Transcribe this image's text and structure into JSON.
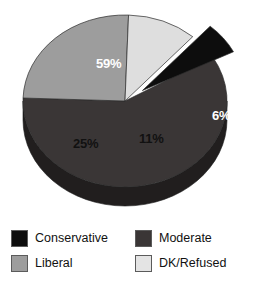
{
  "chart_data": {
    "type": "pie",
    "title": "",
    "subtitle": "",
    "xlabel": "",
    "ylabel": "",
    "style": "3d-exploded",
    "grid": false,
    "legend_position": "bottom",
    "categories": [
      "Conservative",
      "Moderate",
      "Liberal",
      "DK/Refused"
    ],
    "values": [
      6,
      59,
      25,
      11
    ],
    "value_unit": "%",
    "slices": [
      {
        "name": "Moderate",
        "value": 59,
        "label": "59%",
        "color": "#3a3636",
        "side_color": "#211e1e",
        "label_color": "#ffffff",
        "exploded": false,
        "start_deg": 178,
        "end_deg": 390.4
      },
      {
        "name": "Liberal",
        "value": 25,
        "label": "25%",
        "color": "#9d9d9d",
        "side_color": "#6e6e6e",
        "label_color": "#111111",
        "exploded": false,
        "start_deg": 88,
        "end_deg": 178
      },
      {
        "name": "DK/Refused",
        "value": 11,
        "label": "11%",
        "color": "#dedede",
        "side_color": "#aaaaaa",
        "label_color": "#111111",
        "exploded": false,
        "start_deg": 48.4,
        "end_deg": 88
      },
      {
        "name": "Conservative",
        "value": 6,
        "label": "6%",
        "color": "#0d0d0d",
        "side_color": "#000000",
        "label_color": "#ffffff",
        "exploded": true,
        "start_deg": 26.8,
        "end_deg": 48.4
      }
    ],
    "labels": {
      "moderate_pct": "59%",
      "liberal_pct": "25%",
      "dk_refused_pct": "11%",
      "conservative_pct": "6%"
    }
  },
  "legend": {
    "items": [
      {
        "label": "Conservative",
        "color": "#0d0d0d"
      },
      {
        "label": "Moderate",
        "color": "#3a3636"
      },
      {
        "label": "Liberal",
        "color": "#9d9d9d"
      },
      {
        "label": "DK/Refused",
        "color": "#e4e4e4"
      }
    ]
  },
  "footer": {
    "cut_text": ""
  }
}
